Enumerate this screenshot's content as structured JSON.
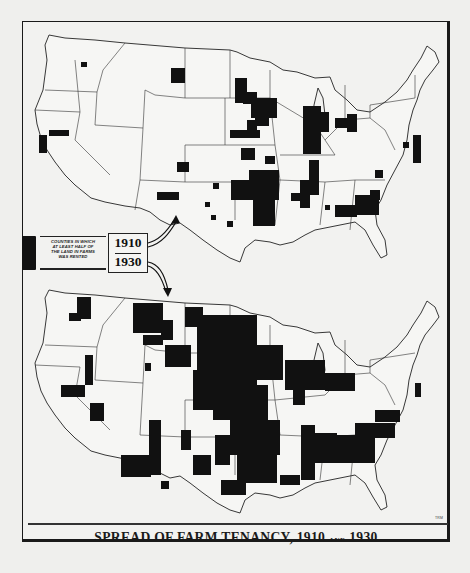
{
  "figure": {
    "title_main": "SPREAD OF FARM TENANCY, 1910",
    "title_and": "AND",
    "title_end": "1930",
    "credit": "TRM"
  },
  "legend": {
    "swatch_color": "#111111",
    "description_lines": [
      "COUNTIES IN WHICH",
      "AT LEAST HALF OF",
      "THE LAND IN FARMS",
      "WAS RENTED"
    ],
    "years": [
      "1910",
      "1930"
    ]
  },
  "maps": [
    {
      "year": "1910",
      "position": "top",
      "description": "Counties in which at least half of the land in farms was rented, 1910",
      "concentrations": [
        "Eastern Dakotas / Iowa / Nebraska border",
        "Central Illinois",
        "Indiana / Ohio",
        "Oklahoma / North Texas",
        "Mississippi Delta",
        "Georgia / Alabama / Carolinas",
        "Montana (isolated block)",
        "Colorado / New Mexico (isolated blocks)",
        "Northern California",
        "Maryland / Delaware"
      ]
    },
    {
      "year": "1930",
      "position": "bottom",
      "description": "Counties in which at least half of the land in farms was rented, 1930",
      "concentrations": [
        "Great Plains from the Dakotas through Texas",
        "Montana and Wyoming",
        "Iowa, Illinois, Indiana",
        "Mississippi Delta",
        "Cotton Belt: Alabama, Georgia, Carolinas",
        "Southern Arizona / Nevada / California",
        "Eastern Washington / Oregon",
        "Gulf Coast Texas and Louisiana"
      ]
    }
  ],
  "colors": {
    "background": "#efefed",
    "ink": "#111111",
    "land": "#f5f5f3"
  }
}
